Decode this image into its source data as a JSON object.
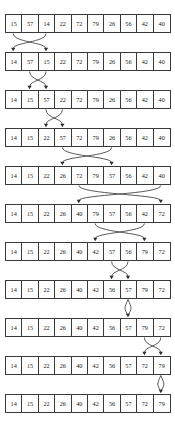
{
  "figure": {
    "array_length": 10,
    "row_count": 12,
    "colors": {
      "border": "#3a3a3a",
      "text": "#1b1b1b",
      "arrow": "#2e2e2e",
      "background": "#ffffff"
    }
  },
  "rows": [
    {
      "index": 0,
      "top": 14,
      "values": [
        "15",
        "57",
        "14",
        "22",
        "72",
        "79",
        "26",
        "56",
        "42",
        "40"
      ]
    },
    {
      "index": 1,
      "top": 52,
      "values": [
        "14",
        "57",
        "15",
        "22",
        "72",
        "79",
        "26",
        "56",
        "42",
        "40"
      ]
    },
    {
      "index": 2,
      "top": 90,
      "values": [
        "14",
        "15",
        "57",
        "22",
        "72",
        "79",
        "26",
        "56",
        "42",
        "40"
      ]
    },
    {
      "index": 3,
      "top": 128,
      "values": [
        "14",
        "15",
        "22",
        "57",
        "72",
        "79",
        "26",
        "56",
        "42",
        "40"
      ]
    },
    {
      "index": 4,
      "top": 166,
      "values": [
        "14",
        "15",
        "22",
        "26",
        "72",
        "79",
        "57",
        "56",
        "42",
        "40"
      ]
    },
    {
      "index": 5,
      "top": 204,
      "values": [
        "14",
        "15",
        "22",
        "26",
        "40",
        "79",
        "57",
        "56",
        "42",
        "72"
      ]
    },
    {
      "index": 6,
      "top": 242,
      "values": [
        "14",
        "15",
        "22",
        "26",
        "40",
        "42",
        "57",
        "56",
        "79",
        "72"
      ]
    },
    {
      "index": 7,
      "top": 280,
      "values": [
        "14",
        "15",
        "22",
        "26",
        "40",
        "42",
        "56",
        "57",
        "79",
        "72"
      ]
    },
    {
      "index": 8,
      "top": 318,
      "values": [
        "14",
        "15",
        "22",
        "26",
        "40",
        "42",
        "56",
        "57",
        "79",
        "72"
      ]
    },
    {
      "index": 9,
      "top": 356,
      "values": [
        "14",
        "15",
        "22",
        "26",
        "40",
        "42",
        "56",
        "57",
        "72",
        "79"
      ]
    },
    {
      "index": 10,
      "top": 394,
      "values": [
        "14",
        "15",
        "22",
        "26",
        "40",
        "42",
        "56",
        "57",
        "72",
        "79"
      ]
    }
  ],
  "swaps": [
    {
      "from_row": 0,
      "a": 0,
      "b": 2,
      "kind": "cross"
    },
    {
      "from_row": 1,
      "a": 1,
      "b": 2,
      "kind": "cross"
    },
    {
      "from_row": 2,
      "a": 2,
      "b": 3,
      "kind": "cross"
    },
    {
      "from_row": 3,
      "a": 3,
      "b": 6,
      "kind": "cross"
    },
    {
      "from_row": 4,
      "a": 4,
      "b": 9,
      "kind": "cross"
    },
    {
      "from_row": 5,
      "a": 5,
      "b": 8,
      "kind": "cross"
    },
    {
      "from_row": 6,
      "a": 6,
      "b": 7,
      "kind": "cross"
    },
    {
      "from_row": 7,
      "a": 7,
      "b": 7,
      "kind": "self"
    },
    {
      "from_row": 8,
      "a": 8,
      "b": 9,
      "kind": "cross"
    },
    {
      "from_row": 9,
      "a": 9,
      "b": 9,
      "kind": "self"
    }
  ]
}
